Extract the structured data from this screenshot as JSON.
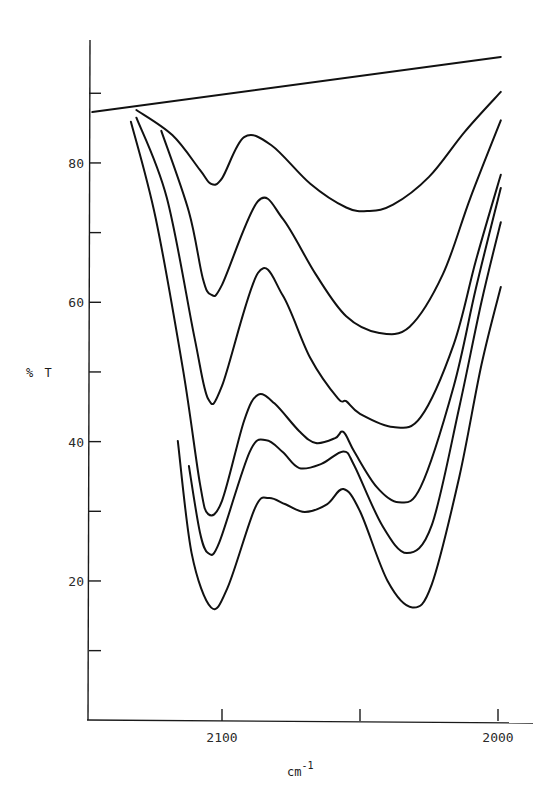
{
  "chart_data": {
    "type": "line",
    "title": "",
    "xlabel": "cm-1",
    "xlabel_base": "cm",
    "xlabel_sup": "-1",
    "ylabel": "% T",
    "xlim": [
      2149,
      1987
    ],
    "ylim": [
      0,
      100
    ],
    "x_reversed": true,
    "grid": false,
    "legend": "none",
    "x_ticks": [
      {
        "value": 2100,
        "label": "2100"
      },
      {
        "value": 2050,
        "label": ""
      },
      {
        "value": 2000,
        "label": "2000"
      }
    ],
    "y_ticks": [
      {
        "value": 90,
        "label": ""
      },
      {
        "value": 80,
        "label": "80"
      },
      {
        "value": 70,
        "label": ""
      },
      {
        "value": 60,
        "label": "60"
      },
      {
        "value": 50,
        "label": ""
      },
      {
        "value": 40,
        "label": "40"
      },
      {
        "value": 30,
        "label": ""
      },
      {
        "value": 20,
        "label": "20"
      },
      {
        "value": 10,
        "label": ""
      }
    ],
    "series": [
      {
        "name": "baseline",
        "x": [
          2147,
          1999
        ],
        "y": [
          87.3,
          95.2
        ],
        "smooth": false
      },
      {
        "name": "spectrum 1",
        "x": [
          2131,
          2118,
          2108,
          2104,
          2100,
          2092,
          2082,
          2068,
          2055,
          2047,
          2038,
          2025,
          2012,
          1999
        ],
        "y": [
          87.6,
          84.0,
          79.0,
          77.0,
          77.8,
          83.7,
          82.5,
          77.0,
          73.6,
          73.1,
          74.0,
          78.0,
          84.5,
          90.2
        ]
      },
      {
        "name": "spectrum 2",
        "x": [
          2122,
          2112,
          2107,
          2104,
          2100,
          2087,
          2078,
          2066,
          2055,
          2043,
          2032,
          2020,
          2010,
          1999
        ],
        "y": [
          84.6,
          73.0,
          63.5,
          61.1,
          62.5,
          74.5,
          72.0,
          64.0,
          58.0,
          55.6,
          56.5,
          64.0,
          75.0,
          86.1
        ]
      },
      {
        "name": "spectrum 3",
        "x": [
          2131,
          2120,
          2110,
          2105,
          2100,
          2087,
          2078,
          2068,
          2058,
          2055,
          2050,
          2038,
          2028,
          2016,
          2008,
          1999
        ],
        "y": [
          86.5,
          75.0,
          55.0,
          46.1,
          48.0,
          64.2,
          61.0,
          52.0,
          46.2,
          45.8,
          44.0,
          42.1,
          43.5,
          54.0,
          66.0,
          78.3
        ]
      },
      {
        "name": "spectrum 4",
        "x": [
          2133,
          2124,
          2114,
          2108,
          2105,
          2100,
          2092,
          2087,
          2081,
          2072,
          2066,
          2059,
          2056,
          2052,
          2044,
          2036,
          2028,
          2016,
          2008,
          1999
        ],
        "y": [
          85.9,
          72.0,
          50.0,
          34.0,
          29.6,
          31.5,
          43.0,
          46.7,
          45.5,
          41.5,
          39.8,
          40.5,
          41.4,
          38.5,
          33.5,
          31.3,
          33.5,
          48.0,
          62.0,
          76.4
        ]
      },
      {
        "name": "spectrum 5",
        "x": [
          2112,
          2108,
          2105,
          2101,
          2090,
          2084,
          2078,
          2072,
          2064,
          2056,
          2052,
          2042,
          2033,
          2024,
          2014,
          2006,
          1999
        ],
        "y": [
          36.5,
          27.0,
          24.0,
          25.5,
          38.5,
          40.2,
          38.5,
          36.2,
          36.8,
          38.6,
          36.5,
          28.0,
          24.0,
          28.0,
          45.0,
          60.0,
          71.5
        ]
      },
      {
        "name": "spectrum 6",
        "x": [
          2116,
          2111,
          2104,
          2098,
          2088,
          2083,
          2077,
          2070,
          2062,
          2056,
          2050,
          2040,
          2031,
          2024,
          2014,
          2006,
          1999
        ],
        "y": [
          40.1,
          24.0,
          16.2,
          19.0,
          30.5,
          31.9,
          31.0,
          29.9,
          31.0,
          33.2,
          30.0,
          20.0,
          16.2,
          19.5,
          35.0,
          51.0,
          62.2
        ]
      }
    ]
  }
}
